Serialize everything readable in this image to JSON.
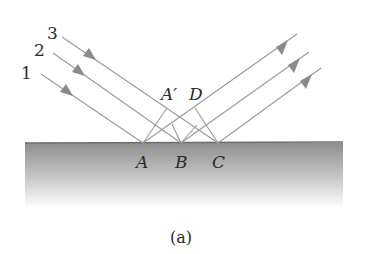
{
  "figure": {
    "caption": "(a)",
    "ray_labels": [
      "1",
      "2",
      "3"
    ],
    "point_labels": {
      "A": "A",
      "B": "B",
      "C": "C",
      "A_prime": "A′",
      "D": "D"
    },
    "colors": {
      "ray": "#9a9a9a",
      "arrow": "#8a8a8a",
      "surface_top": "#8c8c8c",
      "surface_bottom": "#ffffff",
      "text": "#2a2a2a"
    }
  }
}
